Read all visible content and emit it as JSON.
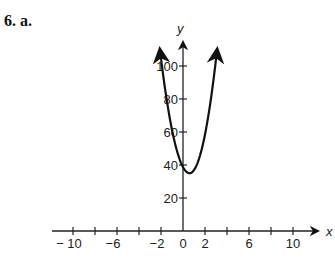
{
  "problem": {
    "label": "6. a."
  },
  "chart_data": {
    "type": "line",
    "title": "",
    "xlabel": "x",
    "ylabel": "y",
    "x_ticks": [
      -10,
      -8,
      -6,
      -4,
      -2,
      0,
      2,
      4,
      6,
      8,
      10
    ],
    "x_tick_labels": [
      "− 10",
      "−6",
      "−2",
      "0",
      "2",
      "6",
      "10"
    ],
    "x_tick_label_values": [
      -10,
      -6,
      -2,
      0,
      2,
      6,
      10
    ],
    "y_ticks": [
      20,
      40,
      60,
      80,
      100
    ],
    "y_tick_labels": [
      "20",
      "40",
      "60",
      "80",
      "100"
    ],
    "xlim": [
      -11,
      12
    ],
    "ylim": [
      0,
      115
    ],
    "grid": false,
    "series": [
      {
        "name": "parabola",
        "description": "Upward-opening parabola with arrows at both ends, vertex near (0.6, 35), y-intercept near 40",
        "vertex": [
          0.6,
          35
        ],
        "y_intercept": 40,
        "x": [
          -2.1,
          -1.5,
          -1,
          -0.5,
          0,
          0.6,
          1,
          1.5,
          2,
          2.5,
          3.1
        ],
        "y": [
          110,
          80,
          62,
          48,
          40,
          35,
          37,
          45,
          58,
          77,
          110
        ]
      }
    ]
  }
}
